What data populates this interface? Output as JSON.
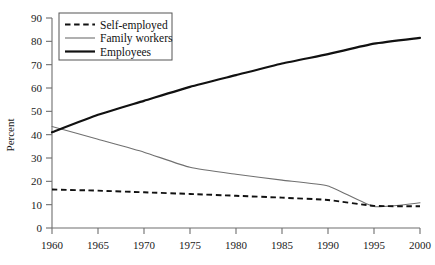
{
  "chart_data": {
    "type": "line",
    "title": "",
    "subtitle": "",
    "xlabel": "",
    "ylabel": "Percent",
    "xlim": [
      1960,
      2000
    ],
    "ylim": [
      0,
      90
    ],
    "grid": false,
    "legend_position": "top-left",
    "x": [
      1960,
      1965,
      1970,
      1975,
      1980,
      1985,
      1990,
      1995,
      2000
    ],
    "xtick_labels": [
      "1960",
      "1965",
      "1970",
      "1975",
      "1980",
      "1985",
      "1990",
      "1995",
      "2000"
    ],
    "ytick_labels": [
      "0",
      "10",
      "20",
      "30",
      "40",
      "50",
      "60",
      "70",
      "80",
      "90"
    ],
    "ytick_values": [
      0,
      10,
      20,
      30,
      40,
      50,
      60,
      70,
      80,
      90
    ],
    "series": [
      {
        "name": "Self-employed",
        "style": "dashed",
        "color": "#111111",
        "values": [
          16.5,
          16.0,
          15.3,
          14.6,
          13.8,
          13.0,
          12.0,
          9.5,
          9.3
        ]
      },
      {
        "name": "Family workers",
        "style": "thin-solid",
        "color": "#707070",
        "values": [
          43.5,
          38.0,
          32.5,
          26.0,
          23.0,
          20.5,
          18.0,
          9.2,
          10.8
        ]
      },
      {
        "name": "Employees",
        "style": "thick-solid",
        "color": "#111111",
        "values": [
          41.0,
          48.5,
          54.5,
          60.5,
          65.5,
          70.5,
          74.5,
          79.0,
          81.5
        ]
      }
    ]
  },
  "legend": {
    "entries": [
      {
        "label": "Self-employed"
      },
      {
        "label": "Family workers"
      },
      {
        "label": "Employees"
      }
    ]
  },
  "axes": {
    "y_title": "Percent"
  }
}
